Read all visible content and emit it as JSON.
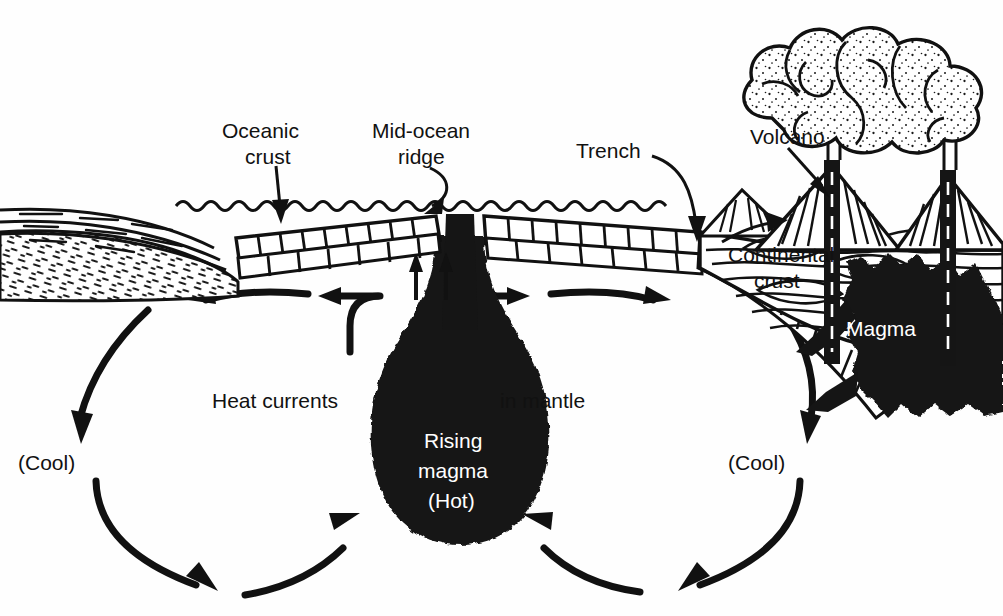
{
  "figure": {
    "style": "black-and-white line drawing",
    "background_color": "#ffffff",
    "ink_color": "#111111"
  },
  "labels": {
    "oceanic_crust": {
      "line1": "Oceanic",
      "line2": "crust"
    },
    "mid_ocean_ridge": {
      "line1": "Mid-ocean",
      "line2": "ridge"
    },
    "trench": {
      "line1": "Trench"
    },
    "volcano": {
      "line1": "Volcano"
    },
    "continental_crust": {
      "line1": "Continental",
      "line2": "crust"
    },
    "magma_body": {
      "line1": "Magma"
    },
    "heat_currents": {
      "line1": "Heat currents"
    },
    "in_mantle": {
      "line1": "in mantle"
    },
    "rising_magma": {
      "line1": "Rising",
      "line2": "magma",
      "line3": "(Hot)"
    },
    "cool_left": {
      "line1": "(Cool)"
    },
    "cool_right": {
      "line1": "(Cool)"
    }
  },
  "features": {
    "sea_surface": "wavy-water-line",
    "oceanic_plate_pattern": "segmented-blocks",
    "continental_crust_pattern": "folded-strata-lines",
    "landmass_pattern": "stipple-dashes",
    "eruption_cloud": "billowing-stippled-cloud",
    "volcano_count": 2,
    "conduit_style": "black-column-with-dashed-centerline"
  },
  "flow_arrows": {
    "ridge_upwelling": {
      "direction": "up",
      "count": 2
    },
    "left_cell": {
      "direction": "counter-clockwise",
      "top_arrows": 2
    },
    "right_cell": {
      "direction": "clockwise",
      "top_arrows": 2
    },
    "left_descending": "down",
    "right_descending": "down",
    "bottom_left_return": "right",
    "bottom_right_return": "left"
  }
}
